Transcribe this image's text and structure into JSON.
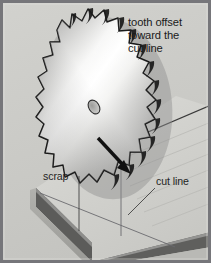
{
  "figure": {
    "width": 211,
    "height": 263,
    "type": "technical-illustration"
  },
  "frame": {
    "border_color": "#76767a",
    "background_color": "#c9c9c5",
    "inner_background_color": "#cfcfcb"
  },
  "annotations": {
    "tooth_offset": {
      "line1": "tooth offset",
      "line2": "toward the",
      "line3": "cut line",
      "color": "#1a1a1a"
    },
    "scrap": {
      "label": "scrap",
      "color": "#1f1f1f"
    },
    "cut_line": {
      "label": "cut line",
      "color": "#1f1f1f"
    }
  },
  "blade": {
    "name": "circular-saw-blade",
    "tooth_count": 14,
    "arbor_hole": "elliptical-arbor-hole",
    "highlight_color": "#ffffff",
    "body_light": "#f2f2f0",
    "body_mid": "#b4b4b2",
    "body_dark": "#6e6e6e",
    "outline_color": "#121212"
  },
  "board": {
    "name": "workpiece-board",
    "top_face_color": "#d6d6d2",
    "edge_band_color": "#5e5e5c",
    "side_face_color": "#a9a9a5",
    "grain_line_color": "#b6b6b2",
    "cut_line_color": "#55555a"
  },
  "arrow": {
    "name": "feed-direction-arrow",
    "color": "#121212",
    "direction": "down-right"
  },
  "colors": {
    "ink": "#121212",
    "frame": "#76767a",
    "paper": "#cfcfcb"
  }
}
